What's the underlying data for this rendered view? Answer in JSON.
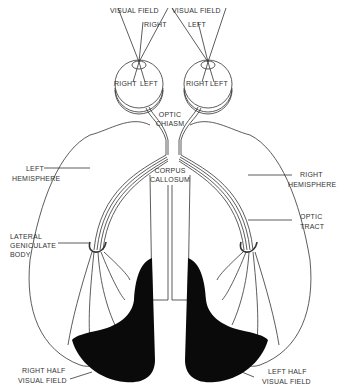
{
  "diagram": {
    "labels": {
      "visual_field_left_eye": "VISUAL FIELD",
      "visual_field_right_eye": "VISUAL FIELD",
      "right_field": "RIGHT",
      "left_field": "LEFT",
      "eye_left_right": "RIGHT",
      "eye_left_left": "LEFT",
      "eye_right_right": "RIGHT",
      "eye_right_left": "LEFT",
      "optic_chiasm_1": "OPTIC",
      "optic_chiasm_2": "CHIASM",
      "corpus_callosum_1": "CORPUS",
      "corpus_callosum_2": "CALLOSUM",
      "left_hemisphere_1": "LEFT",
      "left_hemisphere_2": "HEMISPHERE",
      "right_hemisphere_1": "RIGHT",
      "right_hemisphere_2": "HEMISPHERE",
      "optic_tract_1": "OPTIC",
      "optic_tract_2": "TRACT",
      "lgb_1": "LATERAL",
      "lgb_2": "GENICULATE",
      "lgb_3": "BODY",
      "right_half_1": "RIGHT HALF",
      "right_half_2": "VISUAL FIELD",
      "left_half_1": "LEFT HALF",
      "left_half_2": "VISUAL FIELD"
    },
    "colors": {
      "line": "#333333",
      "fill_dark": "#0a0a0a",
      "background": "#ffffff"
    }
  }
}
